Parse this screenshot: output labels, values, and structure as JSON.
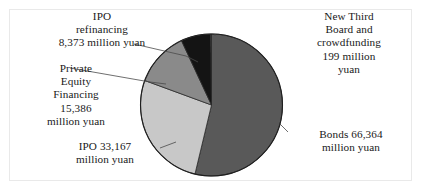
{
  "figure": {
    "background_color": "#ffffff",
    "frame_color": "#e9e9e9"
  },
  "chart_data": {
    "type": "pie",
    "title": "",
    "unit": "million yuan",
    "total": 123489,
    "start_angle_deg": 0,
    "direction": "clockwise",
    "legend": "none",
    "labels_position": "outside-with-leader-lines",
    "categories": [
      "Bonds",
      "IPO",
      "Private Equity Financing",
      "IPO refinancing",
      "New Third Board and crowdfunding"
    ],
    "values": [
      66364,
      33167,
      15386,
      8373,
      199
    ],
    "colors": [
      "#595959",
      "#c8c8c8",
      "#8a8a8a",
      "#141414",
      "#595959"
    ],
    "slices": [
      {
        "name": "Bonds",
        "value": 66364,
        "value_text": "66,364",
        "label_text": "Bonds 66,364\nmillion yuan",
        "color": "#595959",
        "percent": 53.74,
        "angle_deg": 193.47
      },
      {
        "name": "IPO",
        "value": 33167,
        "value_text": "33,167",
        "label_text": "IPO 33,167\nmillion yuan",
        "color": "#c8c8c8",
        "percent": 26.86,
        "angle_deg": 96.71
      },
      {
        "name": "Private Equity Financing",
        "value": 15386,
        "value_text": "15,386",
        "label_text": "Private\nEquity\nFinancing\n15,386\nmillion yuan",
        "color": "#8a8a8a",
        "percent": 12.46,
        "angle_deg": 44.86
      },
      {
        "name": "IPO refinancing",
        "value": 8373,
        "value_text": "8,373",
        "label_text": "IPO\nrefinancing\n8,373 million yuan",
        "color": "#141414",
        "percent": 6.78,
        "angle_deg": 24.41
      },
      {
        "name": "New Third Board and crowdfunding",
        "value": 199,
        "value_text": "199",
        "label_text": "New Third\nBoard and\ncrowdfunding\n199 million\nyuan",
        "color": "#595959",
        "percent": 0.16,
        "angle_deg": 0.58
      }
    ]
  }
}
